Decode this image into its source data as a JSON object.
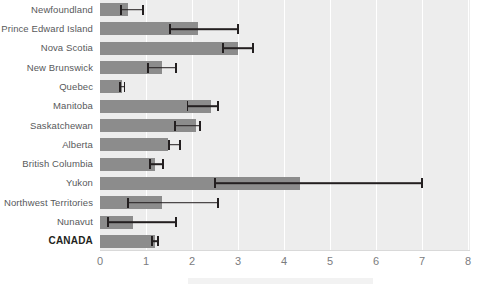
{
  "chart_data": {
    "type": "bar",
    "orientation": "horizontal",
    "title": "",
    "subtitle": "",
    "xlabel": "",
    "ylabel": "",
    "xlim": [
      0,
      8
    ],
    "xticks": [
      "0",
      "1",
      "2",
      "3",
      "4",
      "5",
      "6",
      "7",
      "8"
    ],
    "grid": true,
    "grid_axis": "x",
    "legend": false,
    "error_bars": true,
    "categories": [
      "Newfoundland",
      "Prince Edward Island",
      "Nova Scotia",
      "New Brunswick",
      "Quebec",
      "Manitoba",
      "Saskatchewan",
      "Alberta",
      "British Columbia",
      "Yukon",
      "Northwest Territories",
      "Nunavut",
      "CANADA"
    ],
    "values": [
      0.61,
      2.13,
      3.0,
      1.35,
      0.48,
      2.41,
      2.09,
      1.48,
      1.2,
      4.35,
      1.35,
      0.72,
      1.2
    ],
    "err_low": [
      0.46,
      1.52,
      2.67,
      1.04,
      0.44,
      1.9,
      1.63,
      1.5,
      1.09,
      2.5,
      0.61,
      0.17,
      1.13
    ],
    "err_high": [
      0.93,
      3.0,
      3.33,
      1.65,
      0.53,
      2.57,
      2.17,
      1.74,
      1.37,
      7.0,
      2.57,
      1.65,
      1.26
    ],
    "highlight_category": "CANADA",
    "colors": {
      "bar": "#8c8c8c",
      "plot_background": "#ededed",
      "gridline": "#ffffff",
      "error_bar": "#231f20",
      "label_text": "#58595b",
      "highlight_text": "#231f20",
      "tick_text": "#7b7c7e"
    }
  }
}
